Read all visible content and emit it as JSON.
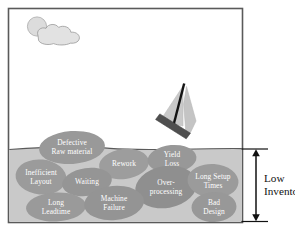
{
  "figure": {
    "title_visible": false,
    "type": "lean-manufacturing-water-and-rocks-diagram",
    "frame": {
      "border_color": "#555555",
      "background_color": "#ffffff"
    },
    "sky": {
      "sun": {
        "name": "sun",
        "color": "#d9d9d9"
      },
      "cloud": {
        "name": "cloud",
        "color": "#e0e0e0"
      }
    },
    "water": {
      "name": "water",
      "color": "#c8c8c8",
      "surface_line_color": "#4d4d4d"
    },
    "boat": {
      "name": "sailboat",
      "hull_color": "#4a4a4a",
      "sail_color": "#c2c2c2",
      "mast_color": "#111111"
    },
    "rocks": [
      {
        "id": "defective-raw-material",
        "lines": [
          "Defective",
          "Raw material"
        ]
      },
      {
        "id": "rework",
        "lines": [
          "Rework"
        ]
      },
      {
        "id": "yield-loss",
        "lines": [
          "Yield",
          "Loss"
        ]
      },
      {
        "id": "inefficient-layout",
        "lines": [
          "Inefficient",
          "Layout"
        ]
      },
      {
        "id": "waiting",
        "lines": [
          "Waiting"
        ]
      },
      {
        "id": "over-processing",
        "lines": [
          "Over-",
          "processing"
        ]
      },
      {
        "id": "long-setup-times",
        "lines": [
          "Long Setup",
          "Times"
        ]
      },
      {
        "id": "long-leadtime",
        "lines": [
          "Long",
          "Leadtime"
        ]
      },
      {
        "id": "machine-failure",
        "lines": [
          "Machine",
          "Failure"
        ]
      },
      {
        "id": "bad-design",
        "lines": [
          "Bad",
          "Design"
        ]
      }
    ],
    "annotation": {
      "id": "low-inventory",
      "lines": [
        "Low",
        "Inventory"
      ],
      "arrow": {
        "style": "double-headed-vertical",
        "color": "#111111"
      }
    },
    "colors": {
      "rock_fill": "#9a9a9a",
      "rock_text": "#ffffff",
      "water_fill": "#c8c8c8",
      "annotation_text": "#111111"
    }
  }
}
